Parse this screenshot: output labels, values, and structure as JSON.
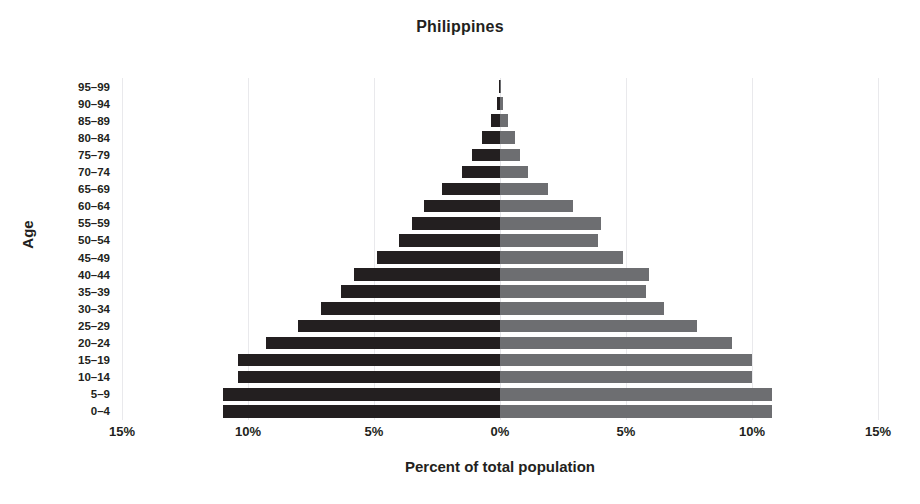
{
  "chart_data": {
    "type": "bar",
    "subtype": "population-pyramid",
    "title": "Philippines",
    "xlabel": "Percent of total population",
    "ylabel": "Age",
    "xlim": [
      -15,
      15
    ],
    "xtick_values": [
      -15,
      -10,
      -5,
      0,
      5,
      10,
      15
    ],
    "xtick_labels": [
      "15%",
      "10%",
      "5%",
      "0%",
      "5%",
      "10%",
      "15%"
    ],
    "grid": true,
    "legend": "none",
    "categories": [
      "0–4",
      "5–9",
      "10–14",
      "15–19",
      "20–24",
      "25–29",
      "30–34",
      "35–39",
      "40–44",
      "45–49",
      "50–54",
      "55–59",
      "60–64",
      "65–69",
      "70–74",
      "75–79",
      "80–84",
      "85–89",
      "90–94",
      "95–99"
    ],
    "series": [
      {
        "name": "Male",
        "side": "left",
        "color": "#231f20",
        "values": [
          11.0,
          11.0,
          10.4,
          10.4,
          9.3,
          8.0,
          7.1,
          6.3,
          5.8,
          4.9,
          4.0,
          3.5,
          3.0,
          2.3,
          1.5,
          1.1,
          0.7,
          0.35,
          0.12,
          0.04
        ]
      },
      {
        "name": "Female",
        "side": "right",
        "color": "#6d6e71",
        "values": [
          10.8,
          10.8,
          10.0,
          10.0,
          9.2,
          7.8,
          6.5,
          5.8,
          5.9,
          4.9,
          3.9,
          4.0,
          2.9,
          1.9,
          1.1,
          0.8,
          0.6,
          0.3,
          0.1,
          0.03
        ]
      }
    ]
  }
}
